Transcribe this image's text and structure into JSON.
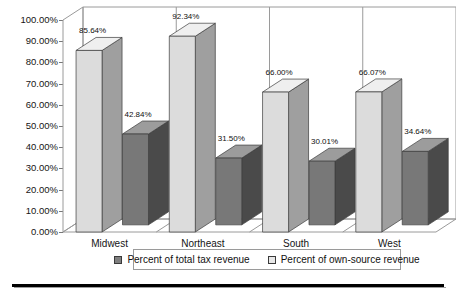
{
  "chart_data": {
    "type": "bar",
    "title": "",
    "subtitle": "",
    "xlabel": "",
    "ylabel": "",
    "categories": [
      "Midwest",
      "Northeast",
      "South",
      "West"
    ],
    "series": [
      {
        "name": "Percent of own-source revenue",
        "color": "#d9d9d9",
        "values": [
          85.64,
          92.34,
          66.0,
          66.07
        ],
        "labels": [
          "85.64%",
          "92.34%",
          "66.00%",
          "66.07%"
        ]
      },
      {
        "name": "Percent of total tax revenue",
        "color": "#7f7f7f",
        "values": [
          42.84,
          31.5,
          30.01,
          34.64
        ],
        "labels": [
          "42.84%",
          "31.50%",
          "30.01%",
          "34.64%"
        ]
      }
    ],
    "ylim": [
      0,
      100
    ],
    "ytick_values": [
      0,
      10,
      20,
      30,
      40,
      50,
      60,
      70,
      80,
      90,
      100
    ],
    "ytick_labels": [
      "0.00%",
      "10.00%",
      "20.00%",
      "30.00%",
      "40.00%",
      "50.00%",
      "60.00%",
      "70.00%",
      "80.00%",
      "90.00%",
      "100.00%"
    ],
    "grid": false,
    "three_d": true,
    "legend_position": "bottom",
    "legend_entries": [
      "Percent of total tax revenue",
      "Percent of own-source revenue"
    ]
  },
  "legend": {
    "entry_dark_label": "Percent of total tax revenue",
    "entry_light_label": "Percent of own-source revenue",
    "dark_color": "#7f7f7f",
    "light_color": "#e2e2e2"
  },
  "colors": {
    "bar_light_front": "#dcdcdc",
    "bar_light_top": "#efefef",
    "bar_light_side": "#9f9f9f",
    "bar_dark_front": "#787878",
    "bar_dark_top": "#9c9c9c",
    "bar_dark_side": "#4a4a4a",
    "frame": "#9a9a9a",
    "floor": "#ffffff",
    "rule": "#000000"
  }
}
